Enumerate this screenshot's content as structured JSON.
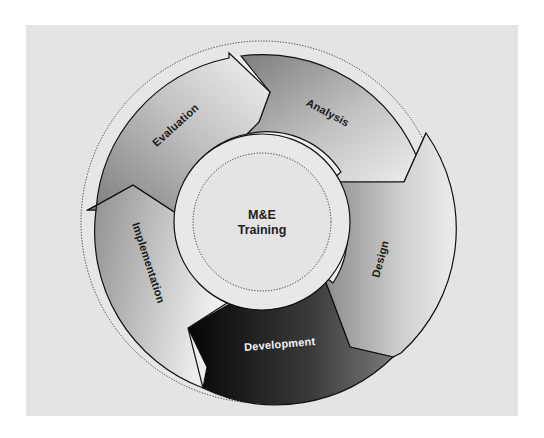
{
  "diagram": {
    "center": {
      "line1": "M&E",
      "line2": "Training"
    },
    "stages": [
      {
        "id": "analysis",
        "label": "Analysis",
        "text_color": "#1a1a1a"
      },
      {
        "id": "design",
        "label": "Design",
        "text_color": "#1a1a1a"
      },
      {
        "id": "development",
        "label": "Development",
        "text_color": "#f2f2f2"
      },
      {
        "id": "implementation",
        "label": "Implementation",
        "text_color": "#1a1a1a"
      },
      {
        "id": "evaluation",
        "label": "Evaluation",
        "text_color": "#1a1a1a"
      }
    ],
    "flow": [
      "Analysis",
      "Design",
      "Development",
      "Implementation",
      "Evaluation"
    ],
    "colors": {
      "panel_background": "#e4e4e4",
      "page_background": "#ffffff",
      "outline": "#111111",
      "highlight_stage": "#141414"
    }
  }
}
